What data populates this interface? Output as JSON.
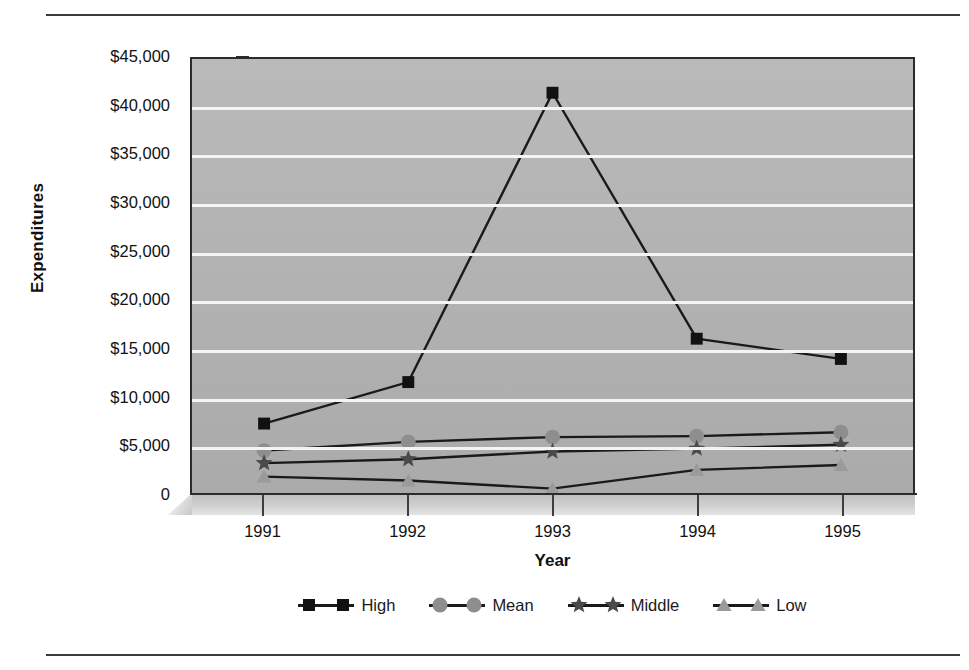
{
  "chart_data": {
    "type": "line",
    "title": "",
    "xlabel": "Year",
    "ylabel": "Expenditures",
    "categories": [
      "1991",
      "1992",
      "1993",
      "1994",
      "1995"
    ],
    "x": [
      1991,
      1992,
      1993,
      1994,
      1995
    ],
    "ylim": [
      0,
      45000
    ],
    "y_tick_values": [
      0,
      5000,
      10000,
      15000,
      20000,
      25000,
      30000,
      35000,
      40000,
      45000
    ],
    "y_tick_labels": [
      "0",
      "$5,000",
      "$10,000",
      "$15,000",
      "$20,000",
      "$25,000",
      "$30,000",
      "$35,000",
      "$40,000",
      "$45,000"
    ],
    "grid": true,
    "grid_color": "#f4f4f4",
    "plot_background": "#b2b2b2",
    "legend_position": "bottom",
    "series": [
      {
        "name": "High",
        "marker": "square",
        "color": "#1a1a1a",
        "marker_color": "#111111",
        "values": [
          7200,
          11500,
          41500,
          16000,
          13900
        ]
      },
      {
        "name": "Mean",
        "marker": "circle",
        "color": "#1a1a1a",
        "marker_color": "#8e8e8e",
        "values": [
          4400,
          5300,
          5800,
          5900,
          6300
        ]
      },
      {
        "name": "Middle",
        "marker": "star",
        "color": "#1a1a1a",
        "marker_color": "#4a4a4a",
        "values": [
          3100,
          3500,
          4300,
          4600,
          5000
        ]
      },
      {
        "name": "Low",
        "marker": "triangle",
        "color": "#1a1a1a",
        "marker_color": "#9a9a9a",
        "values": [
          1700,
          1300,
          450,
          2400,
          2900
        ]
      }
    ]
  },
  "legend": {
    "items": [
      {
        "label": "High",
        "marker": "square",
        "marker_color": "#111111",
        "line_color": "#1a1a1a"
      },
      {
        "label": "Mean",
        "marker": "circle",
        "marker_color": "#8e8e8e",
        "line_color": "#1a1a1a"
      },
      {
        "label": "Middle",
        "marker": "star",
        "marker_color": "#4a4a4a",
        "line_color": "#1a1a1a"
      },
      {
        "label": "Low",
        "marker": "triangle",
        "marker_color": "#9a9a9a",
        "line_color": "#1a1a1a"
      }
    ]
  },
  "axes": {
    "y_title": "Expenditures",
    "x_title": "Year"
  }
}
